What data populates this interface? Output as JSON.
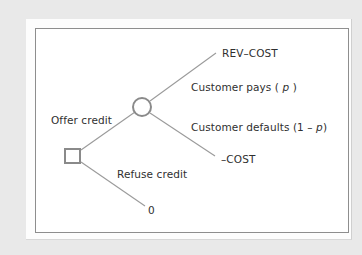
{
  "diagram": {
    "type": "decision-tree",
    "nodes": {
      "decision": {
        "shape": "square",
        "label": ""
      },
      "chance": {
        "shape": "circle",
        "label": ""
      }
    },
    "branches": {
      "offer": {
        "label": "Offer credit"
      },
      "refuse": {
        "label": "Refuse credit",
        "payoff": "0"
      },
      "pays": {
        "label_prefix": "Customer pays ( ",
        "label_var": "p",
        "label_suffix": " )",
        "payoff": "REV–COST"
      },
      "defaults": {
        "label_prefix": "Customer defaults (1 – ",
        "label_var": "p",
        "label_suffix": ")",
        "payoff": "–COST"
      }
    },
    "colors": {
      "background": "#e9e9e9",
      "panel": "#fdfdfd",
      "box_border": "#8e8e8e",
      "line": "#9a9a9a",
      "node_stroke": "#8a8a8a",
      "text": "#2f2f2f"
    }
  }
}
